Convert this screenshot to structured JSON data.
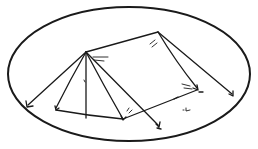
{
  "image": {
    "description": "Hand-drawn line sketch of a tent with guy lines and stakes, enclosed in an ellipse",
    "ink_color": "#1a1a1a",
    "background_color": "#ffffff"
  },
  "ellipse": {
    "cx": 129,
    "cy": 74,
    "rx": 121,
    "ry": 67,
    "stroke_width": 2
  },
  "tent": {
    "front_pole_top": [
      86,
      51
    ],
    "back_pole_top": [
      158,
      32
    ],
    "front_pole_base": [
      86,
      118
    ],
    "front_base_left": [
      56,
      108
    ],
    "front_base_right": [
      123,
      119
    ],
    "back_base_right": [
      197,
      90
    ],
    "guy_lines": [
      {
        "from": [
          86,
          51
        ],
        "to": [
          27,
          106
        ],
        "label": "front-left-guy-line"
      },
      {
        "from": [
          86,
          51
        ],
        "to": [
          159,
          127
        ],
        "label": "front-right-guy-line"
      },
      {
        "from": [
          158,
          32
        ],
        "to": [
          233,
          95
        ],
        "label": "back-right-guy-line"
      }
    ],
    "stakes": [
      {
        "at": [
          27,
          106
        ],
        "label": "stake-front-left"
      },
      {
        "at": [
          159,
          127
        ],
        "label": "stake-front-right"
      },
      {
        "at": [
          233,
          95
        ],
        "label": "stake-back-right"
      },
      {
        "at": [
          197,
          90
        ],
        "label": "stake-back-corner"
      },
      {
        "at": [
          123,
          119
        ],
        "label": "stake-front-corner"
      },
      {
        "at": [
          56,
          108
        ],
        "label": "stake-front-base-left"
      }
    ]
  },
  "marks": [
    {
      "at": [
        186,
        110
      ],
      "label": "small-mark"
    },
    {
      "at": [
        176,
        98
      ],
      "label": "mid-edge-mark"
    }
  ]
}
